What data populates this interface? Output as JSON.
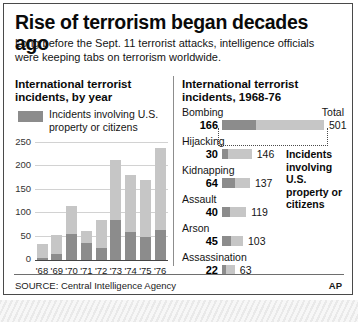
{
  "headline": "Rise of terrorism began decades ago",
  "subhead": "Long before the Sept. 11 terrorist attacks, intelligence officials were keeping tabs on terrorism worldwide.",
  "footer": {
    "source": "SOURCE: Central Intelligence Agency",
    "credit": "AP"
  },
  "left_panel": {
    "title": "International terrorist incidents, by year",
    "legend_label": "Incidents involving U.S. property or citizens"
  },
  "right_panel": {
    "title": "International terrorist incidents, 1968-76",
    "total_header": "Total",
    "annotation": "Incidents involving U.S. property or citizens"
  },
  "chart_data": [
    {
      "type": "bar",
      "title": "International terrorist incidents, by year",
      "stacked": true,
      "xlabel": "",
      "ylabel": "",
      "ylim": [
        0,
        250
      ],
      "yticks": [
        0,
        50,
        100,
        150,
        200,
        250
      ],
      "grid": true,
      "legend": [
        "Incidents involving U.S. property or citizens"
      ],
      "categories": [
        "'68",
        "'69",
        "'70",
        "'71",
        "'72",
        "'73",
        "'74",
        "'75",
        "'76"
      ],
      "series": [
        {
          "name": "Incidents involving U.S. property or citizens",
          "values": [
            5,
            12,
            55,
            37,
            26,
            85,
            59,
            49,
            64
          ]
        },
        {
          "name": "Other incidents",
          "values": [
            30,
            41,
            60,
            25,
            59,
            128,
            123,
            122,
            176
          ]
        }
      ],
      "totals": [
        35,
        53,
        115,
        62,
        85,
        213,
        182,
        171,
        240
      ]
    },
    {
      "type": "bar",
      "orientation": "horizontal",
      "title": "International terrorist incidents, 1968-76",
      "total_header": "Total",
      "xlim": [
        0,
        501
      ],
      "categories": [
        "Bombing",
        "Hijacking",
        "Kidnapping",
        "Assault",
        "Arson",
        "Assassination"
      ],
      "series": [
        {
          "name": "Incidents involving U.S. property or citizens",
          "values": [
            166,
            30,
            64,
            40,
            45,
            22
          ]
        },
        {
          "name": "Total",
          "values": [
            501,
            146,
            137,
            119,
            103,
            63
          ]
        }
      ]
    }
  ]
}
